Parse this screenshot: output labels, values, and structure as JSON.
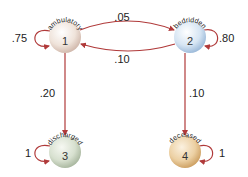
{
  "diagram": {
    "type": "markov-chain",
    "colors": {
      "edge": "#b03a3a",
      "node1": "#f2e8e0",
      "node1_edge": "#c9a89a",
      "node2": "#dde9f5",
      "node2_edge": "#8fb0d3",
      "node3": "#dfe6d8",
      "node3_edge": "#9fb095",
      "node4": "#f0d9b5",
      "node4_edge": "#c89a5c"
    },
    "nodes": [
      {
        "id": "1",
        "number": "1",
        "label": "ambulatory"
      },
      {
        "id": "2",
        "number": "2",
        "label": "bedridden"
      },
      {
        "id": "3",
        "number": "3",
        "label": "discharged"
      },
      {
        "id": "4",
        "number": "4",
        "label": "deceased"
      }
    ],
    "edges": {
      "e11": {
        "from": "1",
        "to": "1",
        "label": ".75"
      },
      "e12": {
        "from": "1",
        "to": "2",
        "label": ".05"
      },
      "e21": {
        "from": "2",
        "to": "1",
        "label": ".10"
      },
      "e22": {
        "from": "2",
        "to": "2",
        "label": ".80"
      },
      "e13": {
        "from": "1",
        "to": "3",
        "label": ".20"
      },
      "e24": {
        "from": "2",
        "to": "4",
        "label": ".10"
      },
      "e33": {
        "from": "3",
        "to": "3",
        "label": "1"
      },
      "e44": {
        "from": "4",
        "to": "4",
        "label": "1"
      }
    }
  }
}
